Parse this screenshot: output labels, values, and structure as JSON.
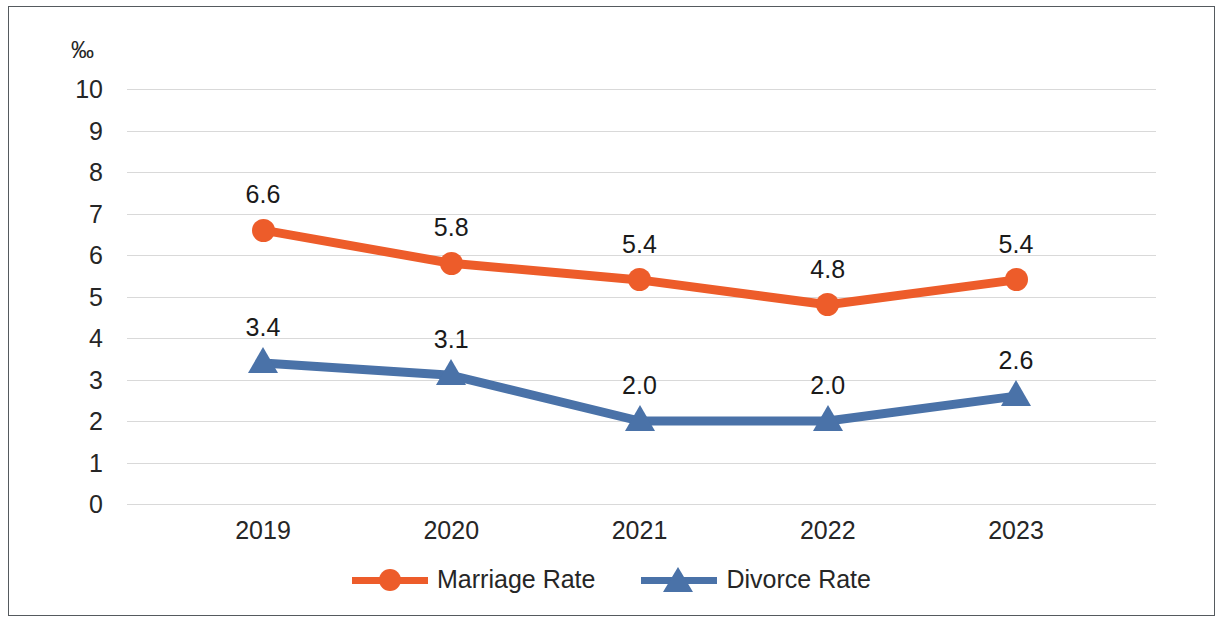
{
  "chart_data": {
    "type": "line",
    "title": "",
    "subtitle": "",
    "xlabel": "",
    "ylabel": "‰",
    "unit_label": "‰",
    "categories": [
      "2019",
      "2020",
      "2021",
      "2022",
      "2023"
    ],
    "ylim": [
      0,
      10
    ],
    "y_ticks": [
      "0",
      "1",
      "2",
      "3",
      "4",
      "5",
      "6",
      "7",
      "8",
      "9",
      "10"
    ],
    "grid": true,
    "legend_position": "bottom",
    "series": [
      {
        "name": "Marriage Rate",
        "color": "#ED5C2A",
        "marker": "circle",
        "values": [
          6.6,
          5.8,
          5.4,
          4.8,
          5.4
        ],
        "labels": [
          "6.6",
          "5.8",
          "5.4",
          "4.8",
          "5.4"
        ]
      },
      {
        "name": "Divorce Rate",
        "color": "#4A72A8",
        "marker": "triangle",
        "values": [
          3.4,
          3.1,
          2.0,
          2.0,
          2.6
        ],
        "labels": [
          "3.4",
          "3.1",
          "2.0",
          "2.0",
          "2.6"
        ]
      }
    ]
  },
  "colors": {
    "marriage": "#ED5C2A",
    "divorce": "#4A72A8",
    "gridline": "#d9d9d9",
    "text": "#262626",
    "border": "#555a5e",
    "background": "#ffffff"
  },
  "legend": {
    "items": [
      {
        "label": "Marriage Rate",
        "color": "#ED5C2A",
        "marker": "circle"
      },
      {
        "label": "Divorce Rate",
        "color": "#4A72A8",
        "marker": "triangle"
      }
    ]
  }
}
